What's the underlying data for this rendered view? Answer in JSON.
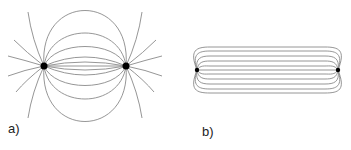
{
  "figure": {
    "panels": [
      {
        "id": "a",
        "label": "a)",
        "description": "Electric field lines between two point charges (dipole)",
        "charges": [
          {
            "x": 44,
            "y": 66
          },
          {
            "x": 126,
            "y": 66
          }
        ]
      },
      {
        "id": "b",
        "label": "b)",
        "description": "Field lines confined to a narrow tube between two charges",
        "charges": [
          {
            "x": 197,
            "y": 70
          },
          {
            "x": 338,
            "y": 70
          }
        ]
      }
    ],
    "colors": {
      "field_line": "#8a8a8a",
      "charge": "#000000"
    }
  }
}
